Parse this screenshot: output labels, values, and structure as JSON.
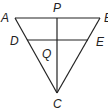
{
  "diagram": {
    "points": {
      "A": "A",
      "B": "B",
      "C": "C",
      "D": "D",
      "E": "E",
      "P": "P",
      "Q": "Q"
    },
    "segments": [
      "AB",
      "AC",
      "BC",
      "DE",
      "PC"
    ]
  }
}
